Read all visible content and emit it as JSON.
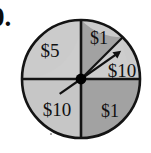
{
  "figure": {
    "kind": "probability-spinner",
    "question_number": "0.",
    "circle": {
      "cx": 81,
      "cy": 79,
      "r": 59
    },
    "outline_color": "#141414",
    "colors": {
      "light_gray": "#c9c9c9",
      "medium_gray": "#a3a3a3",
      "dark_gray": "#9a9a9a",
      "outline": "#141414",
      "hub": "#000000",
      "text": "#111111"
    },
    "sectors": [
      {
        "name": "sector-upper-left",
        "label": "$5",
        "start_angle_deg": 90,
        "end_angle_deg": 180,
        "shade": "light_gray",
        "fill": "#cbcbcb",
        "label_x": 50,
        "label_y": 57
      },
      {
        "name": "sector-top",
        "label": "$1",
        "start_angle_deg": 45,
        "end_angle_deg": 90,
        "shade": "medium_gray",
        "fill": "#a2a2a2",
        "label_x": 89,
        "label_y": 45
      },
      {
        "name": "sector-right",
        "label": "$10",
        "start_angle_deg": 0,
        "end_angle_deg": 45,
        "shade": "light_gray",
        "fill": "#cbcbcb",
        "label_x": 104,
        "label_y": 78
      },
      {
        "name": "sector-lower-left",
        "label": "$10",
        "start_angle_deg": 180,
        "end_angle_deg": 270,
        "shade": "light_gray",
        "fill": "#c6c6c6",
        "label_x": 37,
        "label_y": 117
      },
      {
        "name": "sector-lower-right",
        "label": "$1",
        "start_angle_deg": 270,
        "end_angle_deg": 360,
        "shade": "medium_gray",
        "fill": "#a2a2a2",
        "label_x": 92,
        "label_y": 118
      }
    ],
    "spinner": {
      "hub_radius": 5,
      "pointer_angle_deg": 35,
      "pointer_length": 46,
      "tail_angle_deg": 215,
      "tail_length": 26,
      "has_arrowhead": true
    }
  }
}
